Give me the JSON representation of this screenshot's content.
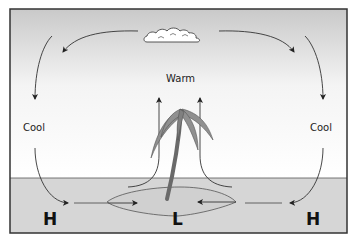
{
  "diagram": {
    "labels": {
      "warm": "Warm",
      "cool_left": "Cool",
      "cool_right": "Cool",
      "high_left": "H",
      "low_center": "L",
      "high_right": "H"
    },
    "colors": {
      "sky_top": "#cfcfcf",
      "sky_bottom": "#ffffff",
      "sea": "#d4d4d4",
      "border": "#333333",
      "palm_leaf": "#8c8c8c",
      "palm_trunk": "#6e6e6e",
      "cloud": "#ffffff"
    },
    "elements": [
      "cloud",
      "palm-tree",
      "island",
      "rising-warm-air-arrows",
      "descending-cool-air-arrows",
      "surface-wind-arrows"
    ]
  }
}
